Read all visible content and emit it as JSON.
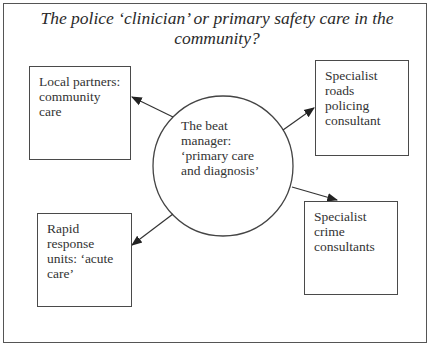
{
  "title": "The police ‘clinician’ or primary safety care in the community?",
  "center": {
    "shape": "circle",
    "label": "The beat\nmanager:\n‘primary care\nand diagnosis’"
  },
  "nodes": [
    {
      "id": "local-partners",
      "position": "top-left",
      "label": "Local partners:\ncommunity\ncare"
    },
    {
      "id": "roads-policing",
      "position": "top-right",
      "label": "Specialist\nroads\npolicing\nconsultant"
    },
    {
      "id": "rapid-response",
      "position": "bottom-left",
      "label": "Rapid\nresponse\nunits: ‘acute\ncare’"
    },
    {
      "id": "crime-consultants",
      "position": "bottom-right",
      "label": "Specialist\ncrime\nconsultants"
    }
  ],
  "edges": [
    {
      "from": "center",
      "to": "local-partners",
      "arrow": "to"
    },
    {
      "from": "center",
      "to": "roads-policing",
      "arrow": "to"
    },
    {
      "from": "center",
      "to": "rapid-response",
      "arrow": "to"
    },
    {
      "from": "center",
      "to": "crime-consultants",
      "arrow": "to"
    }
  ],
  "colors": {
    "line": "#333333",
    "text": "#2a2a2a",
    "background": "#ffffff"
  }
}
